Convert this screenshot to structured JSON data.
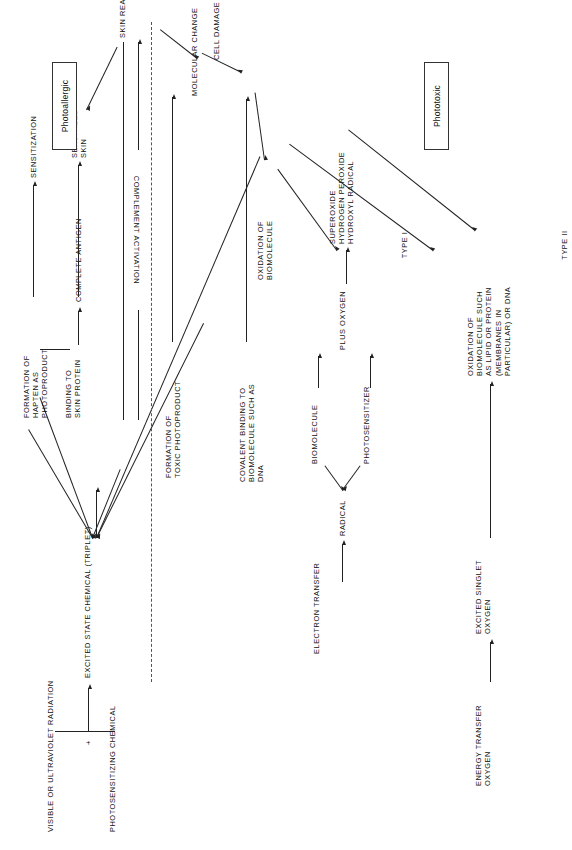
{
  "diagram": {
    "title_nodes": {
      "radiation": "VISIBLE  OR  ULTRAVIOLET  RADIATION",
      "plus_sign": "+",
      "chemical": "PHOTOSENSITIZING  CHEMICAL",
      "excited_state": "EXCITED  STATE  CHEMICAL  (TRIPLET)"
    },
    "photoallergic_branch": {
      "binding": "BINDING  TO\nSKIN PROTEIN",
      "hapten": "FORMATION  OF\nHAPTEN  AS\nPHOTOPRODUCT",
      "complete_antigen": "COMPLETE  ANTIGEN",
      "sensitization": "SENSITIZATION",
      "sensitized_skin": "SENSITIZED\nSKIN",
      "complement": "COMPLEMENT  ACTIVATION"
    },
    "phototoxic_branch": {
      "toxic_photoproduct": "FORMATION  OF\nTOXIC  PHOTOPRODUCT",
      "covalent_binding": "COVALENT  BINDING  TO\nBIOMOLECULE  SUCH  AS\nDNA",
      "electron_transfer": "ELECTRON  TRANSFER",
      "radical": "RADICAL",
      "biomolecule": "BIOMOLECULE",
      "photosensitizer": "PHOTOSENSITIZER",
      "plus_oxygen": "PLUS  OXYGEN",
      "ros": "SUPEROXIDE\nHYDROGEN  PEROXIDE\nHYDROXYL  RADICAL",
      "oxidation_biomolecule": "OXIDATION  OF\nBIOMOLECULE",
      "type_i": "TYPE  I",
      "energy_transfer": "ENERGY  TRANSFER\nOXYGEN",
      "excited_singlet": "EXCITED  SINGLET\nOXYGEN",
      "oxidation_lipid": "OXIDATION  OF\nBIOMOLECULE  SUCH\nAS  LIPID  OR  PROTEIN\n(MEMBRANES  IN\nPARTICULAR)  OR  DNA",
      "type_ii": "TYPE  II"
    },
    "outcome_nodes": {
      "molecular_change": "MOLECULAR  CHANGE",
      "cell_damage": "CELL  DAMAGE",
      "skin_reaction": "SKIN  REACTION"
    },
    "category_labels": {
      "photoallergic": "Photoallergic",
      "phototoxic": "Phototoxic"
    }
  }
}
